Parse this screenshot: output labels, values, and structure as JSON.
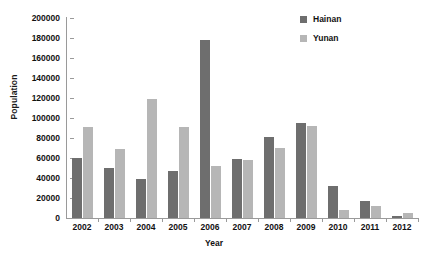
{
  "chart_data": {
    "type": "bar",
    "title": "",
    "xlabel": "Year",
    "ylabel": "Population",
    "categories": [
      "2002",
      "2003",
      "2004",
      "2005",
      "2006",
      "2007",
      "2008",
      "2009",
      "2010",
      "2011",
      "2012"
    ],
    "series": [
      {
        "name": "Hainan",
        "color": "#6e6e6e",
        "values": [
          60000,
          50000,
          39000,
          47000,
          178000,
          59000,
          81000,
          95000,
          32000,
          17000,
          2000
        ]
      },
      {
        "name": "Yunan",
        "color": "#b6b6b6",
        "values": [
          91000,
          69000,
          119000,
          91000,
          52000,
          58000,
          70000,
          92000,
          8000,
          12000,
          5000
        ]
      }
    ],
    "ylim": [
      0,
      200000
    ],
    "ytick_step": 20000,
    "yticks": [
      "0",
      "20000",
      "40000",
      "60000",
      "80000",
      "100000",
      "120000",
      "140000",
      "160000",
      "180000",
      "200000"
    ],
    "grid": false,
    "legend_position": "top-right"
  }
}
